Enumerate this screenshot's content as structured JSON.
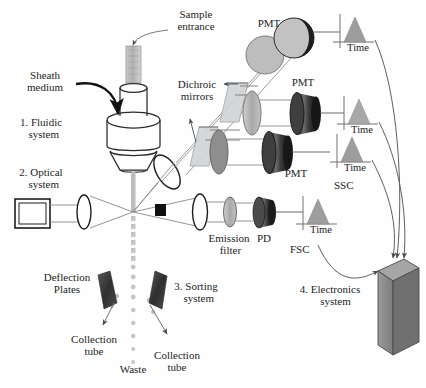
{
  "figure": {
    "type": "diagram"
  },
  "labels": {
    "sample_entrance": "Sample\nentrance",
    "sheath_medium": "Sheath\nmedium",
    "fluidic_system": "1. Fluidic\n  system",
    "optical_system": "2. Optical\n  system",
    "dichroic_mirrors": "Dichroic\nmirrors",
    "deflection_plates": "Deflection\nPlates",
    "sorting_system": "3. Sorting\n  system",
    "collection_tube_left": "Collection\ntube",
    "collection_tube_right": "Collection\ntube",
    "waste": "Waste",
    "emission_filter": "Emission\n filter",
    "pd": "PD",
    "fsc": "FSC",
    "ssc": "SSC",
    "electronics_system": "4. Electronics\n    system",
    "pmt_top": "PMT",
    "pmt_mid": "PMT",
    "pmt_bottom": "PMT",
    "time_1": "Time",
    "time_2": "Time",
    "time_3": "Time",
    "time_4": "Time"
  },
  "colors": {
    "ink": "#1d1d1d",
    "outline": "#2b2b2b",
    "mirror_fill": "#d2d5d8",
    "lens_fill": "#b9babb",
    "pmt_dark": "#2e2e2e",
    "pmt_mid": "#555555",
    "peak_fill": "#9a9a9a",
    "stream_gray": "#c8c8c8",
    "plate_dark": "#3c3c3c",
    "box_face": "#8e8e8e",
    "box_top": "#a5a5a5",
    "box_side": "#6f6f6f",
    "leader": "#6a6a6a"
  },
  "components": {
    "laser": "laser-box",
    "focusing_lens": "focusing-lens",
    "collection_lens": "collection-lens",
    "beam_blocker": "beam-blocker",
    "nozzle": "flow-cell-nozzle",
    "droplet_stream": "droplet-stream",
    "electronics_box": "electronics-box",
    "detector_rows": [
      {
        "name": "row-top",
        "detector": "PMT",
        "signal": "Time"
      },
      {
        "name": "row-middle",
        "detector": "PMT",
        "signal": "Time"
      },
      {
        "name": "row-bottom",
        "detector": "PMT",
        "signal": "Time",
        "channel": "SSC"
      },
      {
        "name": "row-forward",
        "detector": "PD",
        "signal": "Time",
        "channel": "FSC"
      }
    ]
  }
}
